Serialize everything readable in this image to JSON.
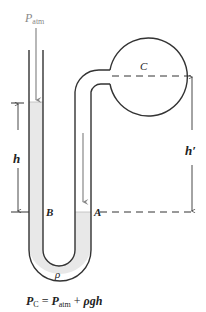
{
  "diagram": {
    "type": "manometer",
    "labels": {
      "p_atm_main": "P",
      "p_atm_sub": "atm",
      "bulb": "C",
      "point_b": "B",
      "point_a": "A",
      "height_left": "h",
      "height_right": "h′",
      "density": "ρ"
    },
    "formula": {
      "lhs_main": "P",
      "lhs_sub": "C",
      "equals": " = ",
      "p_main": "P",
      "p_sub": "atm",
      "plus": " + ",
      "term": "ρgh"
    },
    "colors": {
      "tube_stroke": "#333333",
      "liquid_fill": "#e8e8e8",
      "arrow_gray": "#888888",
      "dashes": "#333333"
    }
  }
}
